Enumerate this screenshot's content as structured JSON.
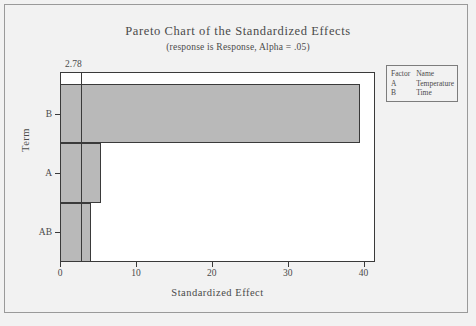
{
  "chart_data": {
    "type": "bar",
    "orientation": "horizontal",
    "title": "Pareto Chart of the Standardized Effects",
    "subtitle": "(response is Response, Alpha = .05)",
    "xlabel": "Standardized Effect",
    "ylabel": "Term",
    "categories": [
      "B",
      "A",
      "AB"
    ],
    "values": [
      39.5,
      5.4,
      4.1
    ],
    "xlim": [
      0,
      41.5
    ],
    "xticks": [
      0,
      10,
      20,
      30,
      40
    ],
    "xtick_labels": [
      "0",
      "10",
      "20",
      "30",
      "40"
    ],
    "grid": false,
    "reference_line": {
      "value": 2.78,
      "label": "2.78"
    },
    "legend": {
      "position": "right",
      "headers": [
        "Factor",
        "Name"
      ],
      "rows": [
        {
          "factor": "A",
          "name": "Temperature"
        },
        {
          "factor": "B",
          "name": "Time"
        }
      ]
    },
    "colors": {
      "bar_fill": "#b9b9b9",
      "bar_border": "#3a3a3a",
      "background": "#f2f2f2",
      "plot_background": "#ffffff",
      "text": "#4a4a4a"
    }
  }
}
